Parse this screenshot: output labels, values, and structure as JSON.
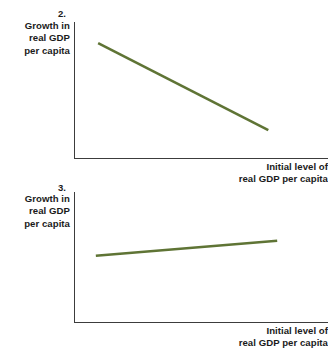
{
  "figure": {
    "panels": [
      {
        "number_label": "2.",
        "y_axis_label_lines": [
          "Growth in",
          "real GDP",
          "per capita"
        ],
        "x_axis_label_lines": [
          "Initial level of",
          "real GDP per capita"
        ]
      },
      {
        "number_label": "3.",
        "y_axis_label_lines": [
          "Growth in",
          "real GDP",
          "per capita"
        ],
        "x_axis_label_lines": [
          "Initial level of",
          "real GDP per capita"
        ]
      }
    ]
  },
  "colors": {
    "line": "#5f7435",
    "axis": "#3c3c3c",
    "text": "#1b1b1b",
    "background": "#ffffff"
  },
  "chart_data": [
    {
      "type": "line",
      "title": "2.",
      "xlabel": "Initial level of real GDP per capita",
      "ylabel": "Growth in real GDP per capita",
      "grid": false,
      "legend": "none",
      "axis_ticks": [],
      "xlim": [
        0,
        1
      ],
      "ylim": [
        0,
        1
      ],
      "series": [
        {
          "name": "Convergence (negative relationship)",
          "slope": "negative",
          "x": [
            0.095,
            0.765
          ],
          "y": [
            0.845,
            0.205
          ]
        }
      ]
    },
    {
      "type": "line",
      "title": "3.",
      "xlabel": "Initial level of real GDP per capita",
      "ylabel": "Growth in real GDP per capita",
      "grid": false,
      "legend": "none",
      "axis_ticks": [],
      "xlim": [
        0,
        1
      ],
      "ylim": [
        0,
        1
      ],
      "series": [
        {
          "name": "Divergence (positive relationship)",
          "slope": "positive",
          "x": [
            0.086,
            0.8
          ],
          "y": [
            0.51,
            0.625
          ]
        }
      ]
    }
  ]
}
